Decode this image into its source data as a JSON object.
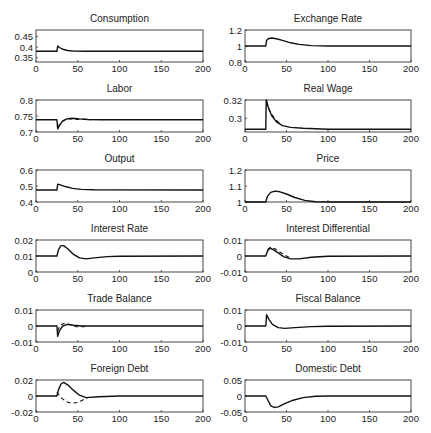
{
  "chart_data": [
    {
      "type": "line",
      "title": "Consumption",
      "xlabel": "",
      "ylabel": "",
      "xlim": [
        0,
        200
      ],
      "ylim": [
        0.33,
        0.48
      ],
      "xticks": [
        0,
        50,
        100,
        150,
        200
      ],
      "yticks": [
        0.35,
        0.4,
        0.45
      ],
      "ytick_labels": [
        "0.35",
        "0.4",
        "0.45"
      ],
      "series": [
        {
          "name": "solid",
          "style": "solid",
          "points": [
            [
              0,
              0.38
            ],
            [
              24,
              0.38
            ],
            [
              25,
              0.38
            ],
            [
              26,
              0.405
            ],
            [
              28,
              0.398
            ],
            [
              32,
              0.39
            ],
            [
              38,
              0.384
            ],
            [
              46,
              0.381
            ],
            [
              60,
              0.38
            ],
            [
              200,
              0.38
            ]
          ]
        }
      ]
    },
    {
      "type": "line",
      "title": "Exchange Rate",
      "xlim": [
        0,
        200
      ],
      "ylim": [
        0.8,
        1.2
      ],
      "xticks": [
        0,
        50,
        100,
        150,
        200
      ],
      "yticks": [
        0.8,
        1,
        1.2
      ],
      "ytick_labels": [
        "0.8",
        "1",
        "1.2"
      ],
      "series": [
        {
          "name": "solid",
          "style": "solid",
          "points": [
            [
              0,
              1
            ],
            [
              24,
              1
            ],
            [
              25,
              1
            ],
            [
              26,
              1.07
            ],
            [
              28,
              1.09
            ],
            [
              32,
              1.1
            ],
            [
              38,
              1.09
            ],
            [
              45,
              1.07
            ],
            [
              55,
              1.04
            ],
            [
              65,
              1.02
            ],
            [
              80,
              1.005
            ],
            [
              100,
              1
            ],
            [
              200,
              1
            ]
          ]
        }
      ]
    },
    {
      "type": "line",
      "title": "Labor",
      "xlim": [
        0,
        200
      ],
      "ylim": [
        0.7,
        0.8
      ],
      "xticks": [
        0,
        50,
        100,
        150,
        200
      ],
      "yticks": [
        0.7,
        0.75,
        0.8
      ],
      "ytick_labels": [
        "0.7",
        "0.75",
        "0.8"
      ],
      "series": [
        {
          "name": "solid",
          "style": "solid",
          "points": [
            [
              0,
              0.738
            ],
            [
              24,
              0.738
            ],
            [
              25,
              0.738
            ],
            [
              26,
              0.71
            ],
            [
              28,
              0.72
            ],
            [
              32,
              0.735
            ],
            [
              38,
              0.742
            ],
            [
              44,
              0.743
            ],
            [
              52,
              0.741
            ],
            [
              62,
              0.739
            ],
            [
              80,
              0.738
            ],
            [
              200,
              0.738
            ]
          ]
        },
        {
          "name": "dashed",
          "style": "dashed",
          "points": [
            [
              26,
              0.715
            ],
            [
              30,
              0.73
            ],
            [
              36,
              0.74
            ],
            [
              42,
              0.741
            ],
            [
              50,
              0.739
            ],
            [
              58,
              0.74
            ],
            [
              66,
              0.738
            ]
          ]
        }
      ]
    },
    {
      "type": "line",
      "title": "Real Wage",
      "xlim": [
        0,
        200
      ],
      "ylim": [
        0.285,
        0.32
      ],
      "xticks": [
        0,
        50,
        100,
        150,
        200
      ],
      "yticks": [
        0.3,
        0.32
      ],
      "ytick_labels": [
        "0.3",
        "0.32"
      ],
      "series": [
        {
          "name": "solid",
          "style": "solid",
          "points": [
            [
              0,
              0.288
            ],
            [
              24,
              0.288
            ],
            [
              25,
              0.288
            ],
            [
              25.5,
              0.32
            ],
            [
              28,
              0.312
            ],
            [
              32,
              0.303
            ],
            [
              38,
              0.296
            ],
            [
              45,
              0.292
            ],
            [
              55,
              0.29
            ],
            [
              70,
              0.289
            ],
            [
              100,
              0.288
            ],
            [
              200,
              0.288
            ]
          ]
        },
        {
          "name": "dashed",
          "style": "dashed",
          "points": [
            [
              26,
              0.318
            ],
            [
              30,
              0.308
            ],
            [
              36,
              0.299
            ],
            [
              44,
              0.293
            ]
          ]
        }
      ]
    },
    {
      "type": "line",
      "title": "Output",
      "xlim": [
        0,
        200
      ],
      "ylim": [
        0.4,
        0.6
      ],
      "xticks": [
        0,
        50,
        100,
        150,
        200
      ],
      "yticks": [
        0.4,
        0.5,
        0.6
      ],
      "ytick_labels": [
        "0.4",
        "0.5",
        "0.6"
      ],
      "series": [
        {
          "name": "solid",
          "style": "solid",
          "points": [
            [
              0,
              0.475
            ],
            [
              24,
              0.475
            ],
            [
              25,
              0.475
            ],
            [
              26,
              0.512
            ],
            [
              30,
              0.505
            ],
            [
              36,
              0.495
            ],
            [
              44,
              0.485
            ],
            [
              54,
              0.479
            ],
            [
              70,
              0.476
            ],
            [
              200,
              0.475
            ]
          ]
        }
      ]
    },
    {
      "type": "line",
      "title": "Price",
      "xlim": [
        0,
        200
      ],
      "ylim": [
        1,
        1.2
      ],
      "xticks": [
        0,
        50,
        100,
        150,
        200
      ],
      "yticks": [
        1,
        1.1,
        1.2
      ],
      "ytick_labels": [
        "1",
        "1.1",
        "1.2"
      ],
      "series": [
        {
          "name": "solid",
          "style": "solid",
          "points": [
            [
              0,
              1
            ],
            [
              24,
              1
            ],
            [
              25,
              1
            ],
            [
              27,
              1.035
            ],
            [
              31,
              1.06
            ],
            [
              36,
              1.068
            ],
            [
              42,
              1.064
            ],
            [
              50,
              1.05
            ],
            [
              60,
              1.028
            ],
            [
              72,
              1.01
            ],
            [
              85,
              1.002
            ],
            [
              100,
              1
            ],
            [
              200,
              1
            ]
          ]
        }
      ]
    },
    {
      "type": "line",
      "title": "Interest Rate",
      "xlim": [
        0,
        200
      ],
      "ylim": [
        0,
        0.02
      ],
      "xticks": [
        0,
        50,
        100,
        150,
        200
      ],
      "yticks": [
        0,
        0.01,
        0.02
      ],
      "ytick_labels": [
        "0",
        "0.01",
        "0.02"
      ],
      "series": [
        {
          "name": "solid",
          "style": "solid",
          "points": [
            [
              0,
              0.01
            ],
            [
              24,
              0.01
            ],
            [
              25,
              0.01
            ],
            [
              27,
              0.014
            ],
            [
              30,
              0.0165
            ],
            [
              33,
              0.0165
            ],
            [
              38,
              0.0145
            ],
            [
              45,
              0.011
            ],
            [
              52,
              0.0088
            ],
            [
              60,
              0.0082
            ],
            [
              70,
              0.0088
            ],
            [
              85,
              0.0096
            ],
            [
              100,
              0.0099
            ],
            [
              200,
              0.01
            ]
          ]
        }
      ]
    },
    {
      "type": "line",
      "title": "Interest Differential",
      "xlim": [
        0,
        200
      ],
      "ylim": [
        -0.01,
        0.01
      ],
      "xticks": [
        0,
        50,
        100,
        150,
        200
      ],
      "yticks": [
        -0.01,
        0,
        0.01
      ],
      "ytick_labels": [
        "-0.01",
        "0",
        "0.01"
      ],
      "series": [
        {
          "name": "solid",
          "style": "solid",
          "points": [
            [
              0,
              0
            ],
            [
              24,
              0
            ],
            [
              25,
              0
            ],
            [
              27,
              0.003
            ],
            [
              30,
              0.005
            ],
            [
              34,
              0.004
            ],
            [
              40,
              0.002
            ],
            [
              47,
              -0.0005
            ],
            [
              55,
              -0.0018
            ],
            [
              65,
              -0.0018
            ],
            [
              80,
              -0.0008
            ],
            [
              100,
              -0.0002
            ],
            [
              200,
              0
            ]
          ]
        },
        {
          "name": "dashed",
          "style": "dashed",
          "points": [
            [
              27,
              0.004
            ],
            [
              31,
              0.0055
            ],
            [
              36,
              0.0045
            ],
            [
              42,
              0.0025
            ],
            [
              48,
              0.0005
            ],
            [
              54,
              -0.001
            ]
          ]
        }
      ]
    },
    {
      "type": "line",
      "title": "Trade Balance",
      "xlim": [
        0,
        200
      ],
      "ylim": [
        -0.01,
        0.01
      ],
      "xticks": [
        0,
        50,
        100,
        150,
        200
      ],
      "yticks": [
        -0.01,
        0,
        0.01
      ],
      "ytick_labels": [
        "-0.01",
        "0",
        "0.01"
      ],
      "series": [
        {
          "name": "solid",
          "style": "solid",
          "points": [
            [
              0,
              0
            ],
            [
              24,
              0
            ],
            [
              25,
              0
            ],
            [
              26,
              -0.0065
            ],
            [
              28,
              -0.003
            ],
            [
              32,
              0
            ],
            [
              38,
              0.001
            ],
            [
              45,
              0.0005
            ],
            [
              55,
              0
            ],
            [
              200,
              0
            ]
          ]
        },
        {
          "name": "dashed",
          "style": "dashed",
          "points": [
            [
              26,
              -0.003
            ],
            [
              29,
              0.0005
            ],
            [
              33,
              0.0015
            ],
            [
              40,
              0.001
            ],
            [
              48,
              -0.0005
            ],
            [
              56,
              -0.0005
            ],
            [
              62,
              0
            ]
          ]
        }
      ]
    },
    {
      "type": "line",
      "title": "Fiscal Balance",
      "xlim": [
        0,
        200
      ],
      "ylim": [
        -0.01,
        0.01
      ],
      "xticks": [
        0,
        50,
        100,
        150,
        200
      ],
      "yticks": [
        -0.01,
        0,
        0.01
      ],
      "ytick_labels": [
        "-0.01",
        "0",
        "0.01"
      ],
      "series": [
        {
          "name": "solid",
          "style": "solid",
          "points": [
            [
              0,
              0
            ],
            [
              24,
              0
            ],
            [
              25,
              0
            ],
            [
              26,
              0.007
            ],
            [
              29,
              0.004
            ],
            [
              33,
              0.001
            ],
            [
              40,
              -0.001
            ],
            [
              48,
              -0.0015
            ],
            [
              60,
              -0.001
            ],
            [
              80,
              -0.0004
            ],
            [
              100,
              -0.0001
            ],
            [
              200,
              0
            ]
          ]
        }
      ]
    },
    {
      "type": "line",
      "title": "Foreign Debt",
      "xlim": [
        0,
        200
      ],
      "ylim": [
        -0.02,
        0.02
      ],
      "xticks": [
        0,
        50,
        100,
        150,
        200
      ],
      "yticks": [
        -0.02,
        0,
        0.02
      ],
      "ytick_labels": [
        "-0.02",
        "0",
        "0.02"
      ],
      "series": [
        {
          "name": "solid",
          "style": "solid",
          "points": [
            [
              0,
              0
            ],
            [
              24,
              0
            ],
            [
              25,
              0
            ],
            [
              27,
              0.008
            ],
            [
              30,
              0.015
            ],
            [
              33,
              0.017
            ],
            [
              38,
              0.014
            ],
            [
              45,
              0.007
            ],
            [
              52,
              0.001
            ],
            [
              60,
              -0.002
            ],
            [
              75,
              -0.001
            ],
            [
              100,
              0
            ],
            [
              200,
              0
            ]
          ]
        },
        {
          "name": "dashed",
          "style": "dashed",
          "points": [
            [
              25,
              0.005
            ],
            [
              30,
              -0.002
            ],
            [
              36,
              -0.007
            ],
            [
              42,
              -0.009
            ],
            [
              50,
              -0.008
            ],
            [
              56,
              -0.005
            ],
            [
              62,
              -0.002
            ]
          ]
        }
      ]
    },
    {
      "type": "line",
      "title": "Domestic Debt",
      "xlim": [
        0,
        200
      ],
      "ylim": [
        -0.05,
        0.05
      ],
      "xticks": [
        0,
        50,
        100,
        150,
        200
      ],
      "yticks": [
        -0.05,
        0,
        0.05
      ],
      "ytick_labels": [
        "-0.05",
        "0",
        "0.05"
      ],
      "series": [
        {
          "name": "solid",
          "style": "solid",
          "points": [
            [
              0,
              0
            ],
            [
              24,
              0
            ],
            [
              25,
              0
            ],
            [
              28,
              -0.015
            ],
            [
              31,
              -0.03
            ],
            [
              35,
              -0.036
            ],
            [
              40,
              -0.034
            ],
            [
              48,
              -0.024
            ],
            [
              58,
              -0.013
            ],
            [
              70,
              -0.005
            ],
            [
              85,
              -0.001
            ],
            [
              100,
              0
            ],
            [
              200,
              0
            ]
          ]
        }
      ]
    }
  ],
  "layout": {
    "columns": 2,
    "rows": 6
  }
}
